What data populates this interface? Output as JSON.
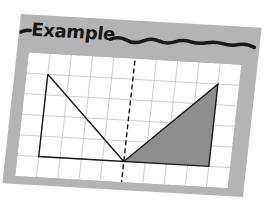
{
  "header": {
    "title": "Example"
  },
  "figure": {
    "grid": {
      "columns": 10,
      "rows": 6
    },
    "line_of_symmetry": {
      "style": "dashed",
      "column": 5
    },
    "shapes": [
      {
        "name": "left-triangle",
        "fill": "none",
        "vertices": [
          [
            1,
            1
          ],
          [
            1,
            5
          ],
          [
            5,
            5
          ]
        ]
      },
      {
        "name": "right-triangle-shaded",
        "fill": "#8e8e8e",
        "vertices": [
          [
            5,
            5
          ],
          [
            9,
            1
          ],
          [
            9,
            5
          ]
        ]
      }
    ],
    "colors": {
      "card": "#b4b4b4",
      "grid_bg": "#ffffff",
      "grid_line": "#bdbdbd",
      "outline": "#1a1a1a",
      "shade": "#8e8e8e"
    }
  }
}
